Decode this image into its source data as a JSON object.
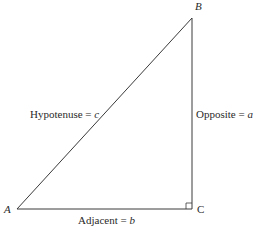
{
  "diagram": {
    "type": "right-triangle",
    "vertices": {
      "A": {
        "label": "A",
        "x": 17,
        "y": 209
      },
      "B": {
        "label": "B",
        "x": 192,
        "y": 18
      },
      "C": {
        "label": "C",
        "x": 192,
        "y": 209
      }
    },
    "sides": {
      "hypotenuse": {
        "name": "Hypotenuse",
        "eq": " = ",
        "var": "c"
      },
      "opposite": {
        "name": "Opposite",
        "eq": " = ",
        "var": "a"
      },
      "adjacent": {
        "name": "Adjacent",
        "eq": " = ",
        "var": "b"
      }
    },
    "right_angle_at": "C",
    "colors": {
      "line": "#3a3a3a",
      "text": "#2a2a2a",
      "background": "#ffffff"
    }
  }
}
